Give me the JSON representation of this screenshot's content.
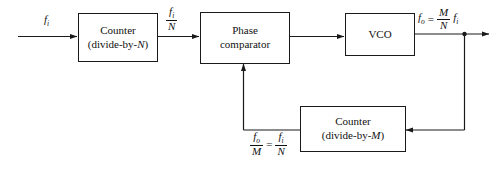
{
  "diagram": {
    "type": "block-diagram",
    "background_color": "#ffffff",
    "line_color": "#1a1a1a",
    "blocks": [
      {
        "id": "counter-n",
        "line1": "Counter",
        "line2_prefix": "(divide-by-",
        "line2_var": "N",
        "line2_suffix": ")"
      },
      {
        "id": "phase-comparator",
        "line1": "Phase",
        "line2": "comparator"
      },
      {
        "id": "vco",
        "line1": "VCO"
      },
      {
        "id": "counter-m",
        "line1": "Counter",
        "line2_prefix": "(divide-by-",
        "line2_var": "M",
        "line2_suffix": ")"
      }
    ],
    "labels": {
      "input": {
        "symbol": "f",
        "subscript": "i"
      },
      "counter_n_output": {
        "numerator_symbol": "f",
        "numerator_sub": "i",
        "denominator": "N"
      },
      "vco_output": {
        "lhs_symbol": "f",
        "lhs_sub": "o",
        "equals": "=",
        "numerator": "M",
        "denominator": "N",
        "rhs_symbol": "f",
        "rhs_sub": "i"
      },
      "feedback": {
        "left_num_symbol": "f",
        "left_num_sub": "o",
        "left_den": "M",
        "equals": "=",
        "right_num_symbol": "f",
        "right_num_sub": "i",
        "right_den": "N"
      }
    }
  }
}
